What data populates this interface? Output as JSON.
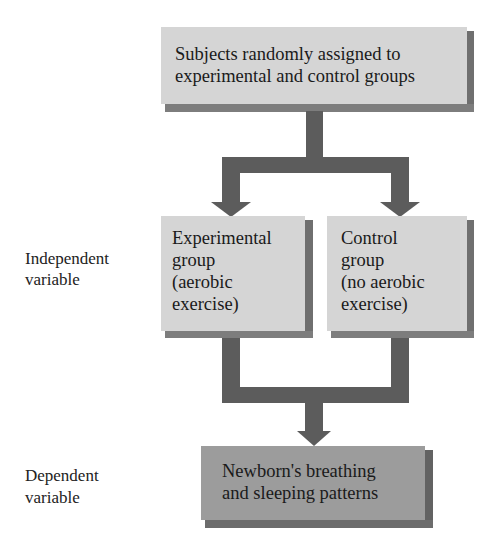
{
  "diagram": {
    "colors": {
      "box_light": "#d5d5d5",
      "box_dark": "#9c9c9c",
      "shadow": "#777777",
      "connector": "#5c5c5c",
      "text": "#1a1a1a"
    },
    "nodes": {
      "top": {
        "line1": "Subjects randomly assigned to",
        "line2": "experimental and control groups"
      },
      "experimental": {
        "line1": "Experimental",
        "line2": "group",
        "line3": "(aerobic",
        "line4": "exercise)"
      },
      "control": {
        "line1": "Control",
        "line2": "group",
        "line3": "(no aerobic",
        "line4": "exercise)"
      },
      "outcome": {
        "line1": "Newborn's breathing",
        "line2": "and sleeping patterns"
      }
    },
    "side_labels": {
      "independent": {
        "line1": "Independent",
        "line2": "variable"
      },
      "dependent": {
        "line1": "Dependent",
        "line2": "variable"
      }
    },
    "edges": [
      {
        "from": "top",
        "to": "experimental"
      },
      {
        "from": "top",
        "to": "control"
      },
      {
        "from": "experimental",
        "to": "outcome"
      },
      {
        "from": "control",
        "to": "outcome"
      }
    ]
  }
}
